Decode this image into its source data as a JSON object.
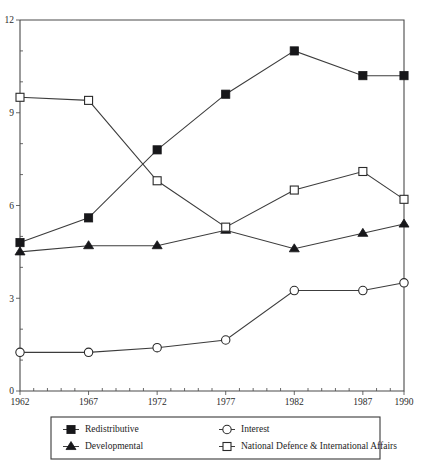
{
  "chart_data": {
    "type": "line",
    "title": "",
    "subtitle": "",
    "xlabel": "",
    "ylabel": "",
    "categories": [
      "1962",
      "1967",
      "1972",
      "1977",
      "1982",
      "1987",
      "1990"
    ],
    "x_tick_labels": [
      "1962",
      "1967",
      "1972",
      "1977",
      "1982",
      "1987",
      "1990"
    ],
    "y_tick_labels": [
      "0",
      "3",
      "6",
      "9",
      "12"
    ],
    "y_ticks": [
      0,
      3,
      6,
      9,
      12
    ],
    "ylim": [
      0,
      12
    ],
    "xlim": [
      1962,
      1990
    ],
    "grid": false,
    "legend_position": "bottom",
    "series": [
      {
        "name": "Redistributive",
        "marker": "filled-square",
        "values": [
          4.8,
          5.6,
          7.8,
          9.6,
          11.0,
          10.2,
          10.2
        ]
      },
      {
        "name": "Developmental",
        "marker": "filled-triangle",
        "values": [
          4.5,
          4.7,
          4.7,
          5.2,
          4.6,
          5.1,
          5.4
        ]
      },
      {
        "name": "Interest",
        "marker": "open-circle",
        "values": [
          1.25,
          1.25,
          1.4,
          1.65,
          3.25,
          3.25,
          3.5
        ]
      },
      {
        "name": "National Defence & International Affairs",
        "marker": "open-square",
        "values": [
          9.5,
          9.4,
          6.8,
          5.3,
          6.5,
          7.1,
          6.2
        ]
      }
    ]
  },
  "legend": {
    "entries": [
      {
        "label": "Redistributive",
        "marker": "filled-square"
      },
      {
        "label": "Interest",
        "marker": "open-circle"
      },
      {
        "label": "Developmental",
        "marker": "filled-triangle"
      },
      {
        "label": "National Defence & International Affairs",
        "marker": "open-square"
      }
    ]
  },
  "colors": {
    "ink": "#1a1a1a",
    "axis": "#4a4a4a",
    "line": "#3c3c3c",
    "marker_fill": "#17171a",
    "marker_open_fill": "#ffffff",
    "background": "#ffffff"
  }
}
